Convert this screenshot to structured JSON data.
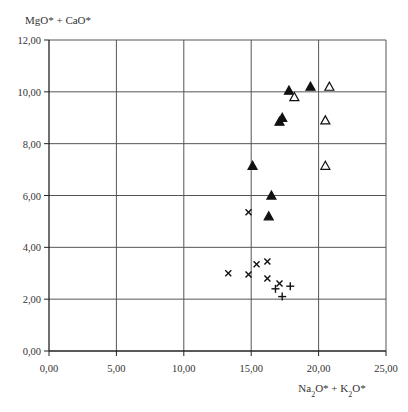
{
  "chart_data": {
    "type": "scatter",
    "title": "",
    "xlabel": "Na2O* + K2O*",
    "ylabel": "MgO* + CaO*",
    "xlabel_parts": {
      "a": "Na",
      "a_sub": "2",
      "b": "O* + K",
      "b_sub": "2",
      "c": "O*"
    },
    "xlim": [
      0,
      25
    ],
    "ylim": [
      0,
      12
    ],
    "xticks": [
      0,
      5,
      10,
      15,
      20,
      25
    ],
    "yticks": [
      0,
      2,
      4,
      6,
      8,
      10,
      12
    ],
    "xtick_labels": [
      "0,00",
      "5,00",
      "10,00",
      "15,00",
      "20,00",
      "25,00"
    ],
    "ytick_labels": [
      "0,00",
      "2,00",
      "4,00",
      "6,00",
      "8,00",
      "10,00",
      "12,00"
    ],
    "grid": true,
    "legend": null,
    "series": [
      {
        "name": "filled-triangle",
        "marker": "filled-triangle",
        "color": "#111111",
        "points": [
          [
            17.8,
            10.05
          ],
          [
            19.4,
            10.2
          ],
          [
            17.3,
            9.0
          ],
          [
            17.1,
            8.85
          ],
          [
            15.1,
            7.15
          ],
          [
            16.5,
            6.0
          ],
          [
            16.3,
            5.2
          ]
        ]
      },
      {
        "name": "open-triangle",
        "marker": "open-triangle",
        "color": "#111111",
        "points": [
          [
            20.8,
            10.2
          ],
          [
            18.2,
            9.8
          ],
          [
            20.5,
            8.9
          ],
          [
            20.5,
            7.15
          ]
        ]
      },
      {
        "name": "cross-x",
        "marker": "x",
        "color": "#111111",
        "points": [
          [
            14.8,
            5.35
          ],
          [
            13.3,
            3.0
          ],
          [
            14.8,
            2.95
          ],
          [
            15.4,
            3.35
          ],
          [
            16.2,
            3.45
          ],
          [
            16.2,
            2.8
          ],
          [
            17.1,
            2.6
          ]
        ]
      },
      {
        "name": "plus",
        "marker": "plus",
        "color": "#111111",
        "points": [
          [
            16.8,
            2.4
          ],
          [
            17.9,
            2.5
          ],
          [
            17.3,
            2.1
          ]
        ]
      }
    ]
  }
}
